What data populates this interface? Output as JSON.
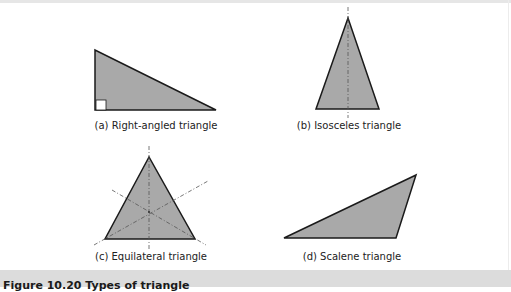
{
  "figure": {
    "panels": [
      {
        "id": "a",
        "label": "(a) Right-angled triangle",
        "shape": "right-angled-triangle",
        "marker": "right-angle-square"
      },
      {
        "id": "b",
        "label": "(b) Isosceles triangle",
        "shape": "isosceles-triangle",
        "marker": "axis-of-symmetry"
      },
      {
        "id": "c",
        "label": "(c) Equilateral triangle",
        "shape": "equilateral-triangle",
        "marker": "three-axes-of-symmetry"
      },
      {
        "id": "d",
        "label": "(d) Scalene triangle",
        "shape": "scalene-triangle",
        "marker": "none"
      }
    ],
    "caption": "Figure 10.20 Types of triangle"
  },
  "colors": {
    "fill": "#a9a9a9",
    "stroke": "#1a1a1a",
    "dash": "#666666",
    "caption_band": "#dcdcdc"
  }
}
